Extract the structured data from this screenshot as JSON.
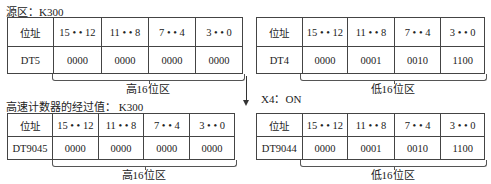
{
  "source_label": "源区：K300",
  "counter_label": "高速计数器的经过值： K300",
  "condition_label": "X4：ON",
  "header_row": [
    "位址",
    "15 • • 12",
    "11 • • 8",
    "7 • • 4",
    "3 • • 0"
  ],
  "tables": {
    "dt5": {
      "name": "DT5",
      "values": [
        "0000",
        "0000",
        "0000",
        "0000"
      ],
      "brace": "高16位区"
    },
    "dt4": {
      "name": "DT4",
      "values": [
        "0000",
        "0001",
        "0010",
        "1100"
      ],
      "brace": "低16位区"
    },
    "dt9045": {
      "name": "DT9045",
      "values": [
        "0000",
        "0000",
        "0000",
        "0000"
      ],
      "brace": "高16位区"
    },
    "dt9044": {
      "name": "DT9044",
      "values": [
        "0000",
        "0001",
        "0010",
        "1100"
      ],
      "brace": "低16位区"
    }
  }
}
